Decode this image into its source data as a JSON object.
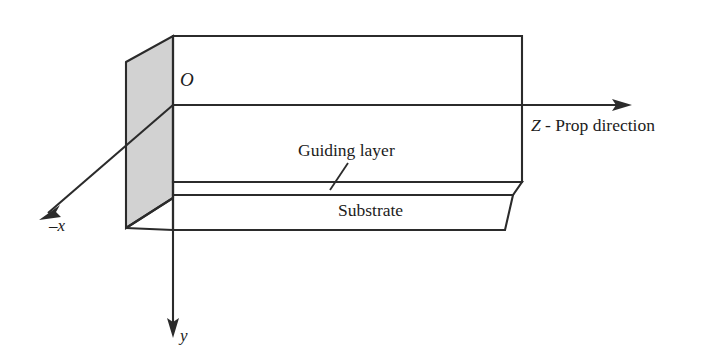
{
  "figure": {
    "colors": {
      "line": "#2b2b2b",
      "shaded_face_fill": "#d2d2d2",
      "background": "#ffffff",
      "text": "#1c1c1c"
    },
    "labels": {
      "origin": "O",
      "z_axis_symbol": "Z",
      "z_axis_rest": " - Prop direction",
      "z_axis_full": "Z - Prop direction",
      "guiding_layer": "Guiding layer",
      "substrate": "Substrate",
      "neg_x_axis_sign": "–",
      "neg_x_axis_symbol": "x",
      "neg_x_axis_full": "–x",
      "y_axis": "y"
    },
    "geometry": {
      "origin_point": [
        173,
        105
      ],
      "z_axis_arrow_tip": [
        632,
        105
      ],
      "neg_x_axis_arrow_tip": [
        39,
        219
      ],
      "y_axis_arrow_tip": [
        173,
        338
      ],
      "box_front_top_left": [
        173,
        36
      ],
      "box_front_top_right": [
        522,
        36
      ],
      "box_front_bottom_left": [
        173,
        230
      ],
      "box_front_bottom_right": [
        505,
        230
      ],
      "shaded_face_top_left": [
        126,
        62
      ],
      "shaded_face_bottom_left": [
        126,
        228
      ],
      "guiding_layer_top_y": 182,
      "guiding_layer_bottom_y": 195,
      "substrate_bottom_y": 230
    }
  }
}
